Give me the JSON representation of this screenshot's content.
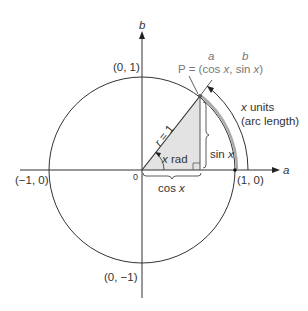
{
  "diagram": {
    "axes": {
      "horizontal_label": "a",
      "vertical_label": "b",
      "origin_label": "0"
    },
    "points": {
      "top": "(0, 1)",
      "bottom": "(0, −1)",
      "left": "(−1, 0)",
      "right": "(1, 0)"
    },
    "point_p": {
      "prefix": "P = (cos ",
      "x1": "x",
      "mid": ", sin ",
      "x2": "x",
      "suffix": ")",
      "a_label": "a",
      "b_label": "b"
    },
    "labels": {
      "radius": "r = 1",
      "angle_x": "x",
      "angle_rad": " rad",
      "sin_prefix": "sin ",
      "sin_x": "x",
      "cos_prefix": "cos ",
      "cos_x": "x",
      "arc_x": "x",
      "arc_units": " units",
      "arc_length": "(arc length)"
    },
    "colors": {
      "line": "#333333",
      "triangle_fill": "#e3e3e3",
      "arc_highlight": "#aaaaaa",
      "point_label": "#777777"
    }
  }
}
